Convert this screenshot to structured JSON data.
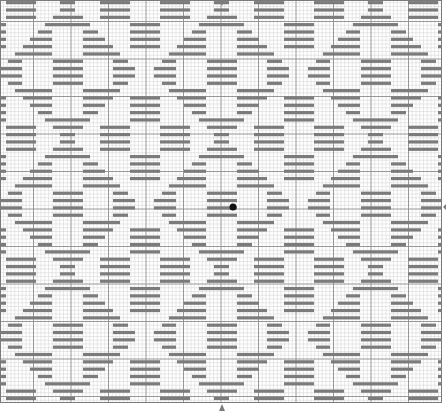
{
  "canvas": {
    "width": 446,
    "height": 414
  },
  "grid": {
    "left": 0,
    "top": 0,
    "right": 442,
    "bottom": 403,
    "cell_size": 3.75,
    "major_every": 10,
    "major_offset_x": 33.5,
    "major_offset_y": 21.5,
    "minor_color": "#d9d9d9",
    "major_color": "#8c8c8c"
  },
  "stitch_color": "#7b7b7b",
  "bar_height": 3.2,
  "row_pitch": 7.33,
  "pattern": {
    "period_x": 154,
    "period_rows": 18,
    "diamond_center_x": 68,
    "apex_y": 10,
    "diamond_rows": [
      [
        [
          -8,
          7
        ]
      ],
      [
        [
          -15,
          15
        ]
      ],
      [
        [
          -23,
          22
        ]
      ],
      [
        [
          -30,
          -16
        ],
        [
          15,
          30
        ]
      ],
      [
        [
          -38,
          -16
        ],
        [
          15,
          37
        ]
      ],
      [
        [
          -45,
          -16
        ],
        [
          15,
          45
        ]
      ],
      [
        [
          -53,
          -16
        ],
        [
          15,
          52
        ]
      ],
      [
        [
          -60,
          -46
        ],
        [
          -15,
          15
        ],
        [
          45,
          60
        ]
      ],
      [
        [
          -68,
          -46
        ],
        [
          -15,
          15
        ],
        [
          45,
          67
        ]
      ],
      [
        [
          -68,
          -46
        ],
        [
          -15,
          15
        ],
        [
          45,
          67
        ]
      ],
      [
        [
          -60,
          -46
        ],
        [
          -15,
          15
        ],
        [
          45,
          60
        ]
      ],
      [
        [
          -53,
          -16
        ],
        [
          15,
          52
        ]
      ],
      [
        [
          -45,
          -16
        ],
        [
          15,
          45
        ]
      ],
      [
        [
          -38,
          -16
        ],
        [
          15,
          37
        ]
      ],
      [
        [
          -30,
          -16
        ],
        [
          15,
          30
        ]
      ],
      [
        [
          -23,
          22
        ]
      ],
      [
        [
          -15,
          15
        ]
      ],
      [
        [
          -8,
          7
        ]
      ]
    ],
    "interstitial_offset_x": 77,
    "interstitial_rows": [
      {
        "row": 2,
        "bars": [
          [
            -15,
            15
          ]
        ]
      },
      {
        "row": 3,
        "bars": [
          [
            -15,
            15
          ]
        ]
      },
      {
        "row": 4,
        "bars": [
          [
            -15,
            15
          ]
        ]
      },
      {
        "row": 5,
        "bars": [
          [
            -15,
            15
          ]
        ]
      },
      {
        "row": 12,
        "bars": [
          [
            -15,
            15
          ]
        ]
      },
      {
        "row": 13,
        "bars": [
          [
            -15,
            15
          ]
        ]
      },
      {
        "row": 14,
        "bars": [
          [
            -15,
            15
          ]
        ]
      },
      {
        "row": 15,
        "bars": [
          [
            -15,
            15
          ]
        ]
      },
      {
        "row": 16,
        "bars": [
          [
            -45,
            -15
          ],
          [
            15,
            45
          ]
        ]
      },
      {
        "row": 17,
        "bars": [
          [
            -45,
            -15
          ],
          [
            15,
            45
          ]
        ]
      },
      {
        "row": 18,
        "bars": [
          [
            -45,
            -15
          ],
          [
            15,
            45
          ]
        ]
      },
      {
        "row": 19,
        "bars": [
          [
            -45,
            -15
          ],
          [
            15,
            45
          ]
        ]
      }
    ]
  },
  "markers": {
    "top": {
      "x": 222,
      "y": 0,
      "direction": "down"
    },
    "bottom": {
      "x": 222,
      "y": 404,
      "direction": "up"
    },
    "right": {
      "x": 443,
      "y": 207,
      "direction": "left"
    }
  },
  "cursor_dot": {
    "x": 233,
    "y": 207,
    "r": 3.5
  }
}
